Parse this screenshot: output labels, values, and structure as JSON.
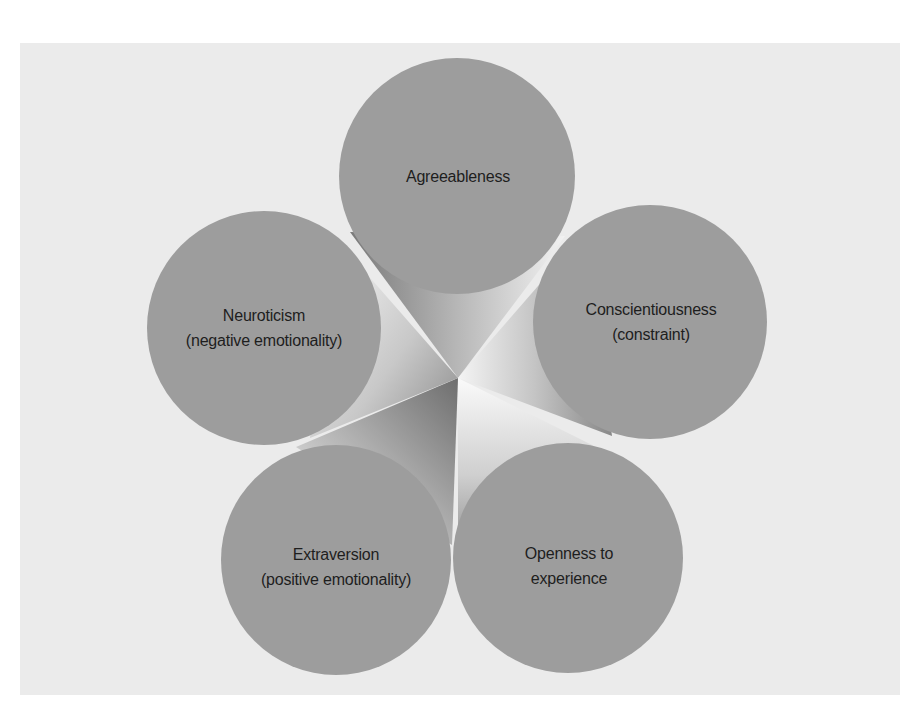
{
  "diagram": {
    "type": "five-factor-model",
    "colors": {
      "background": "#ffffff",
      "panel": "#ebebeb",
      "circle_fill": "#9d9d9d",
      "text": "#1e1e1e"
    },
    "center": {
      "x": 458,
      "y": 378
    },
    "factors": [
      {
        "id": "agreeableness",
        "line1": "Agreeableness",
        "line2": "",
        "cx": 457,
        "cy": 176,
        "r": 118
      },
      {
        "id": "conscientiousness",
        "line1": "Conscientiousness",
        "line2": "(constraint)",
        "cx": 650,
        "cy": 322,
        "r": 117
      },
      {
        "id": "openness",
        "line1": "Openness to",
        "line2": "experience",
        "cx": 568,
        "cy": 558,
        "r": 115
      },
      {
        "id": "extraversion",
        "line1": "Extraversion",
        "line2": "(positive emotionality)",
        "cx": 336,
        "cy": 560,
        "r": 115
      },
      {
        "id": "neuroticism",
        "line1": "Neuroticism",
        "line2": "(negative emotionality)",
        "cx": 264,
        "cy": 328,
        "r": 117
      }
    ]
  }
}
